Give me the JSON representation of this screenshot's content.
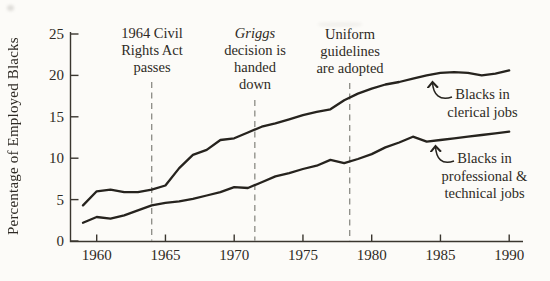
{
  "chart_data": {
    "type": "line",
    "title": "",
    "xlabel": "",
    "ylabel": "Percentage of Employed Blacks",
    "years": [
      1959,
      1960,
      1961,
      1962,
      1963,
      1964,
      1965,
      1966,
      1967,
      1968,
      1969,
      1970,
      1971,
      1972,
      1973,
      1974,
      1975,
      1976,
      1977,
      1978,
      1979,
      1980,
      1981,
      1982,
      1983,
      1984,
      1985,
      1986,
      1987,
      1988,
      1989,
      1990
    ],
    "series": [
      {
        "name": "Blacks in clerical jobs",
        "values": [
          4.3,
          6.0,
          6.2,
          5.9,
          5.9,
          6.2,
          6.7,
          8.8,
          10.4,
          11.0,
          12.2,
          12.4,
          13.1,
          13.8,
          14.2,
          14.7,
          15.2,
          15.6,
          15.9,
          17.0,
          17.8,
          18.4,
          18.9,
          19.2,
          19.6,
          20.0,
          20.3,
          20.4,
          20.3,
          20.0,
          20.2,
          20.6
        ]
      },
      {
        "name": "Blacks in professional & technical jobs",
        "values": [
          2.2,
          2.9,
          2.7,
          3.1,
          3.7,
          4.3,
          4.6,
          4.8,
          5.1,
          5.5,
          5.9,
          6.5,
          6.4,
          7.1,
          7.8,
          8.2,
          8.7,
          9.1,
          9.8,
          9.4,
          9.9,
          10.5,
          11.3,
          11.9,
          12.6,
          12.0,
          12.2,
          12.4,
          12.6,
          12.8,
          13.0,
          13.2
        ]
      }
    ],
    "x_ticks": [
      1960,
      1965,
      1970,
      1975,
      1980,
      1985,
      1990
    ],
    "y_ticks": [
      0,
      5,
      10,
      15,
      20,
      25
    ],
    "xlim": [
      1958.8,
      1991
    ],
    "ylim": [
      0,
      25
    ],
    "grid": false,
    "legend_position": "inline-annotations-right",
    "event_lines": [
      {
        "year": 1964,
        "label": "1964 Civil Rights Act passes"
      },
      {
        "year": 1971.5,
        "label": "Griggs decision is handed down"
      },
      {
        "year": 1978.4,
        "label": "Uniform guidelines are adopted"
      }
    ],
    "colors": {
      "line": "#26231e",
      "axis": "#3a362f",
      "dashed_line": "#8b8b85",
      "text": "#2e2a24",
      "background": "#fcfbf8"
    }
  },
  "annotations": [
    {
      "year": 1964,
      "lines": [
        "1964 Civil",
        "Rights Act",
        "passes"
      ]
    },
    {
      "year": 1971.5,
      "lines": [
        "Griggs",
        "decision is",
        "handed",
        "down"
      ]
    },
    {
      "year": 1978.4,
      "lines": [
        "Uniform",
        "guidelines",
        "are adopted"
      ]
    }
  ],
  "series_labels": {
    "clerical": [
      "Blacks in",
      "clerical jobs"
    ],
    "professional": [
      "Blacks in",
      "professional &",
      "technical jobs"
    ]
  }
}
